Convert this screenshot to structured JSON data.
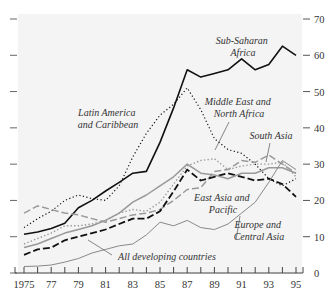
{
  "chart_data": {
    "type": "line",
    "title": "",
    "xlabel": "",
    "ylabel": "",
    "x": [
      1975,
      1976,
      1977,
      1978,
      1979,
      1980,
      1981,
      1982,
      1983,
      1984,
      1985,
      1986,
      1987,
      1988,
      1989,
      1990,
      1991,
      1992,
      1993,
      1994,
      1995
    ],
    "x_tick_labels": [
      "1975",
      "77",
      "79",
      "81",
      "83",
      "85",
      "87",
      "89",
      "91",
      "93",
      "95"
    ],
    "x_tick_values": [
      1975,
      1977,
      1979,
      1981,
      1983,
      1985,
      1987,
      1989,
      1991,
      1993,
      1995
    ],
    "y_tick_values": [
      0,
      10,
      20,
      30,
      40,
      50,
      60,
      70
    ],
    "y_tick_labels": [
      "0",
      "10",
      "20",
      "30",
      "40",
      "50",
      "60",
      "70"
    ],
    "xlim": [
      1975,
      1995
    ],
    "ylim": [
      0,
      70
    ],
    "y_axis_side": "right",
    "grid": false,
    "background": "#f4f4f4",
    "series": [
      {
        "name": "Sub-Saharan Africa",
        "style": "solid-black",
        "values": [
          10.7,
          11.3,
          12.3,
          13.7,
          18.0,
          20.0,
          22.6,
          25.0,
          27.5,
          28.0,
          36.0,
          45.5,
          56.0,
          54.0,
          55.0,
          56.0,
          59.0,
          56.0,
          57.5,
          62.5,
          60.0
        ]
      },
      {
        "name": "Latin America and Caribbean",
        "style": "dotted-black",
        "values": [
          12.5,
          15.0,
          17.0,
          20.0,
          21.5,
          20.5,
          20.0,
          24.0,
          32.0,
          38.5,
          43.5,
          46.5,
          51.0,
          45.0,
          37.0,
          34.0,
          33.0,
          30.0,
          26.0,
          24.0,
          26.0
        ]
      },
      {
        "name": "Middle East and North Africa",
        "style": "dotted-gray",
        "values": [
          8.0,
          9.5,
          11.0,
          13.0,
          13.0,
          13.5,
          14.5,
          16.5,
          17.5,
          17.0,
          19.5,
          24.5,
          29.5,
          31.0,
          31.5,
          28.5,
          29.5,
          30.0,
          30.0,
          30.5,
          26.5
        ]
      },
      {
        "name": "South Asia",
        "style": "dashed-gray",
        "values": [
          16.5,
          18.5,
          17.5,
          16.5,
          16.0,
          15.0,
          14.0,
          15.0,
          16.0,
          16.5,
          17.5,
          20.0,
          23.0,
          23.5,
          28.0,
          28.5,
          31.0,
          30.5,
          32.5,
          30.0,
          27.5
        ]
      },
      {
        "name": "East Asia and Pacific",
        "style": "dashed-black",
        "values": [
          5.0,
          6.5,
          7.0,
          9.0,
          10.0,
          11.0,
          12.0,
          13.5,
          15.0,
          15.0,
          17.0,
          22.5,
          28.5,
          25.5,
          26.5,
          27.5,
          26.5,
          25.5,
          26.0,
          24.5,
          21.0
        ]
      },
      {
        "name": "All developing countries",
        "style": "solid-gray",
        "values": [
          7.0,
          8.0,
          9.5,
          11.0,
          12.0,
          13.0,
          14.5,
          16.5,
          19.5,
          21.5,
          24.0,
          26.5,
          30.0,
          27.5,
          27.0,
          26.0,
          27.5,
          27.5,
          29.0,
          29.0,
          27.5
        ]
      },
      {
        "name": "Europe and Central Asia",
        "style": "solid-gray-thin",
        "values": [
          1.8,
          1.9,
          2.2,
          3.0,
          4.0,
          5.5,
          6.5,
          7.5,
          8.0,
          10.5,
          14.0,
          13.0,
          14.5,
          12.5,
          12.0,
          13.5,
          16.5,
          19.5,
          25.0,
          31.0,
          28.5
        ]
      }
    ],
    "annotations": [
      {
        "text_lines": [
          "Sub-Saharan",
          "Africa"
        ],
        "series": "Sub-Saharan Africa"
      },
      {
        "text_lines": [
          "Latin America",
          "and Caribbean"
        ],
        "series": "Latin America and Caribbean"
      },
      {
        "text_lines": [
          "Middle East and",
          "North Africa"
        ],
        "series": "Middle East and North Africa"
      },
      {
        "text_lines": [
          "South Asia"
        ],
        "series": "South Asia"
      },
      {
        "text_lines": [
          "East Asia and",
          "Pacific"
        ],
        "series": "East Asia and Pacific"
      },
      {
        "text_lines": [
          "Europe and",
          "Central Asia"
        ],
        "series": "Europe and Central Asia"
      },
      {
        "text_lines": [
          "All developing countries"
        ],
        "series": "All developing countries"
      }
    ]
  }
}
